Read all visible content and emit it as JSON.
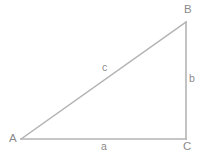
{
  "diagram": {
    "type": "right-triangle",
    "background_color": "#ffffff",
    "line_color": "#b3b3b3",
    "label_color": "#8a8a8a",
    "width": 204,
    "height": 157,
    "vertices": [
      {
        "name": "A",
        "label": "A",
        "x": 21,
        "y": 139,
        "angle_type": "acute"
      },
      {
        "name": "B",
        "label": "B",
        "x": 186,
        "y": 22,
        "angle_type": "acute"
      },
      {
        "name": "C",
        "label": "C",
        "x": 186,
        "y": 139,
        "angle_type": "right"
      }
    ],
    "sides": [
      {
        "name": "a",
        "label": "a",
        "from": "A",
        "to": "C",
        "role": "adjacent-base",
        "x1": 21,
        "y1": 139,
        "x2": 186,
        "y2": 139
      },
      {
        "name": "b",
        "label": "b",
        "from": "C",
        "to": "B",
        "role": "opposite-height",
        "x1": 186,
        "y1": 139,
        "x2": 186,
        "y2": 22
      },
      {
        "name": "c",
        "label": "c",
        "from": "A",
        "to": "B",
        "role": "hypotenuse",
        "x1": 21,
        "y1": 139,
        "x2": 186,
        "y2": 22
      }
    ]
  }
}
